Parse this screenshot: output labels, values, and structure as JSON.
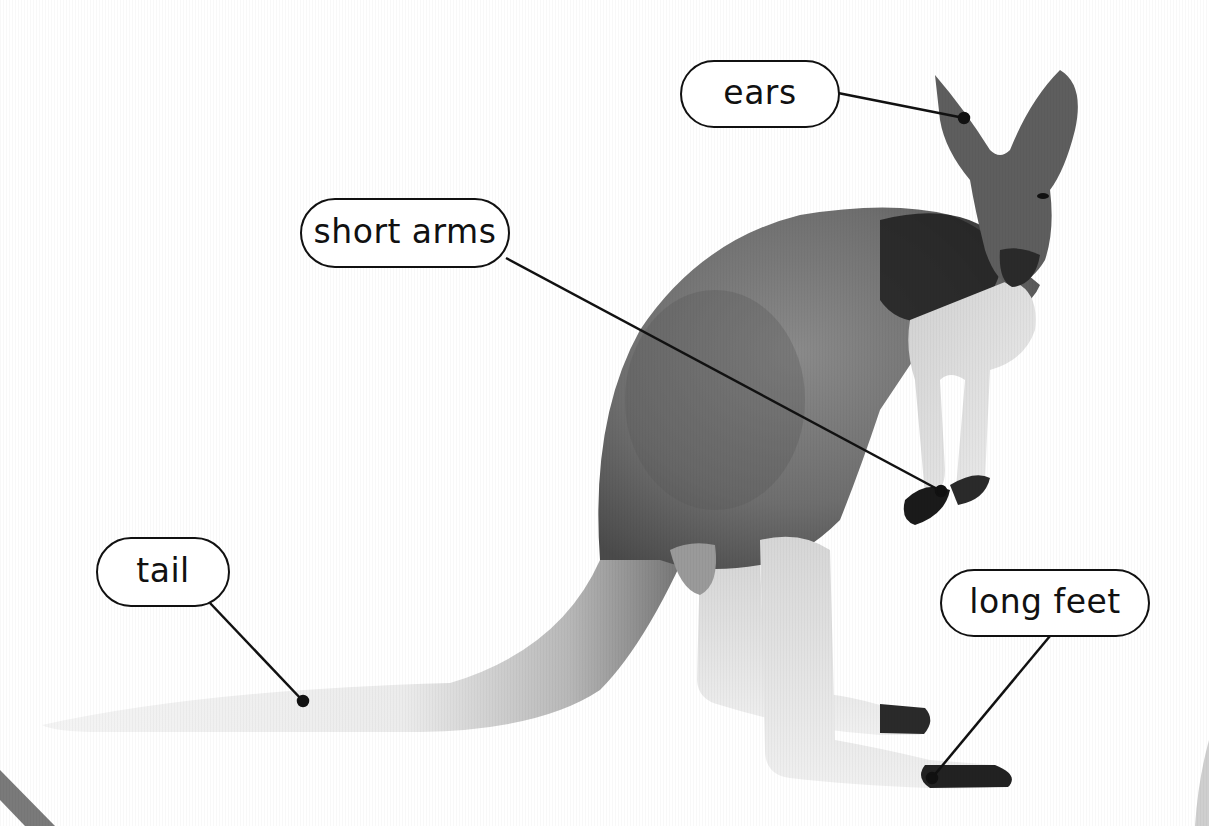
{
  "diagram": {
    "labels": [
      {
        "id": "ears",
        "text": "ears",
        "box": [
          680,
          60,
          160,
          68
        ],
        "anchor": [
          960,
          117
        ]
      },
      {
        "id": "short-arms",
        "text": "short arms",
        "box": [
          300,
          198,
          210,
          70
        ],
        "anchor": [
          941,
          491
        ]
      },
      {
        "id": "tail",
        "text": "tail",
        "box": [
          96,
          537,
          134,
          70
        ],
        "anchor": [
          303,
          701
        ]
      },
      {
        "id": "long-feet",
        "text": "long feet",
        "box": [
          940,
          569,
          210,
          68
        ],
        "anchor": [
          932,
          780
        ]
      }
    ]
  }
}
